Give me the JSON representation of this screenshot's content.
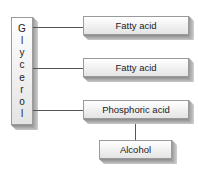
{
  "diagram": {
    "backbone": {
      "label": "Glycerol",
      "letters": [
        "G",
        "l",
        "y",
        "c",
        "e",
        "r",
        "o",
        "l"
      ]
    },
    "components": [
      {
        "label": "Fatty acid"
      },
      {
        "label": "Fatty acid"
      },
      {
        "label": "Phosphoric acid"
      }
    ],
    "attached": {
      "label": "Alcohol",
      "attached_to": "Phosphoric acid"
    }
  }
}
